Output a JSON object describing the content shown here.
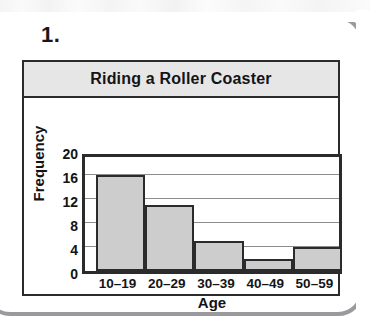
{
  "question": {
    "number_label": "1."
  },
  "chart_data": {
    "type": "bar",
    "title": "Riding a Roller Coaster",
    "xlabel": "Age",
    "ylabel": "Frequency",
    "categories": [
      "10–19",
      "20–29",
      "30–39",
      "40–49",
      "50–59"
    ],
    "values": [
      16,
      11,
      5,
      2,
      4
    ],
    "ylim": [
      0,
      20
    ],
    "ytick_labels": [
      "0",
      "4",
      "8",
      "12",
      "16",
      "20"
    ],
    "ytick_values": [
      0,
      4,
      8,
      12,
      16,
      20
    ],
    "grid": "horizontal",
    "legend": "none",
    "histogram_style": "adjacent-bars",
    "colors": {
      "bar_fill": "#cdcdcd",
      "bar_outline": "#2b2b2d",
      "title_banner": "#e6e6e6",
      "gridline": "#8d8d90",
      "text": "#141416",
      "page_frame": "#9a9a9e"
    }
  }
}
